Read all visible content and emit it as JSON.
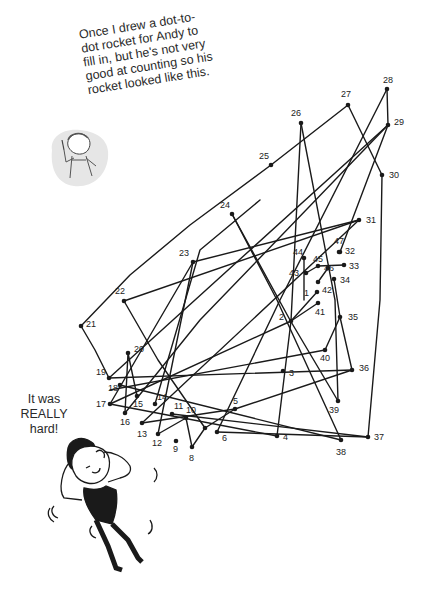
{
  "caption": {
    "lines": [
      "Once I drew a dot-to-",
      "dot rocket for Andy to",
      "fill in, but he's not very",
      "good at counting so his",
      "rocket looked like this."
    ]
  },
  "speech": {
    "lines": [
      "It was",
      "REALLY",
      "hard!"
    ]
  },
  "colors": {
    "ink": "#1a1a1a",
    "background": "#ffffff",
    "shading": "#e4e4e4"
  },
  "icons": [
    "cartoon-narrator-with-pencil",
    "cartoon-andy-stressed"
  ],
  "dots": [
    {
      "n": "1",
      "x": 317,
      "y": 292,
      "lx": 304,
      "ly": 296
    },
    {
      "n": "2",
      "x": 291,
      "y": 321,
      "lx": 279,
      "ly": 320
    },
    {
      "n": "3",
      "x": 283,
      "y": 371,
      "lx": 289,
      "ly": 376
    },
    {
      "n": "4",
      "x": 277,
      "y": 436,
      "lx": 283,
      "ly": 440
    },
    {
      "n": "5",
      "x": 235,
      "y": 409,
      "lx": 233,
      "ly": 404
    },
    {
      "n": "6",
      "x": 217,
      "y": 432,
      "lx": 222,
      "ly": 441
    },
    {
      "n": "7",
      "x": 205,
      "y": 428,
      "lx": 0,
      "ly": 0,
      "hidden_label": true
    },
    {
      "n": "8",
      "x": 192,
      "y": 447,
      "lx": 189,
      "ly": 461
    },
    {
      "n": "9",
      "x": 176,
      "y": 441,
      "lx": 173,
      "ly": 452
    },
    {
      "n": "10",
      "x": 186,
      "y": 418,
      "lx": 186,
      "ly": 413
    },
    {
      "n": "11",
      "x": 172,
      "y": 414,
      "lx": 174,
      "ly": 409
    },
    {
      "n": "12",
      "x": 158,
      "y": 434,
      "lx": 152,
      "ly": 446
    },
    {
      "n": "13",
      "x": 142,
      "y": 423,
      "lx": 137,
      "ly": 437
    },
    {
      "n": "14",
      "x": 155,
      "y": 404,
      "lx": 157,
      "ly": 400
    },
    {
      "n": "15",
      "x": 137,
      "y": 396,
      "lx": 133,
      "ly": 407
    },
    {
      "n": "16",
      "x": 125,
      "y": 413,
      "lx": 120,
      "ly": 425
    },
    {
      "n": "17",
      "x": 110,
      "y": 404,
      "lx": 96,
      "ly": 407
    },
    {
      "n": "18",
      "x": 120,
      "y": 385,
      "lx": 108,
      "ly": 391
    },
    {
      "n": "19",
      "x": 109,
      "y": 378,
      "lx": 96,
      "ly": 375
    },
    {
      "n": "20",
      "x": 128,
      "y": 353,
      "lx": 134,
      "ly": 352
    },
    {
      "n": "21",
      "x": 81,
      "y": 326,
      "lx": 86,
      "ly": 327
    },
    {
      "n": "22",
      "x": 124,
      "y": 301,
      "lx": 115,
      "ly": 294
    },
    {
      "n": "23",
      "x": 193,
      "y": 262,
      "lx": 179,
      "ly": 256
    },
    {
      "n": "24",
      "x": 232,
      "y": 214,
      "lx": 220,
      "ly": 208
    },
    {
      "n": "25",
      "x": 271,
      "y": 165,
      "lx": 259,
      "ly": 159
    },
    {
      "n": "26",
      "x": 301,
      "y": 123,
      "lx": 291,
      "ly": 116
    },
    {
      "n": "27",
      "x": 348,
      "y": 105,
      "lx": 341,
      "ly": 97
    },
    {
      "n": "28",
      "x": 387,
      "y": 89,
      "lx": 383,
      "ly": 83
    },
    {
      "n": "29",
      "x": 388,
      "y": 125,
      "lx": 394,
      "ly": 125
    },
    {
      "n": "30",
      "x": 382,
      "y": 175,
      "lx": 389,
      "ly": 178
    },
    {
      "n": "31",
      "x": 359,
      "y": 220,
      "lx": 366,
      "ly": 223
    },
    {
      "n": "32",
      "x": 340,
      "y": 252,
      "lx": 345,
      "ly": 254
    },
    {
      "n": "33",
      "x": 344,
      "y": 265,
      "lx": 349,
      "ly": 269
    },
    {
      "n": "34",
      "x": 334,
      "y": 279,
      "lx": 340,
      "ly": 283
    },
    {
      "n": "35",
      "x": 340,
      "y": 317,
      "lx": 348,
      "ly": 320
    },
    {
      "n": "36",
      "x": 352,
      "y": 370,
      "lx": 359,
      "ly": 371
    },
    {
      "n": "37",
      "x": 368,
      "y": 437,
      "lx": 374,
      "ly": 440
    },
    {
      "n": "38",
      "x": 341,
      "y": 440,
      "lx": 336,
      "ly": 455
    },
    {
      "n": "39",
      "x": 338,
      "y": 401,
      "lx": 329,
      "ly": 413
    },
    {
      "n": "40",
      "x": 325,
      "y": 350,
      "lx": 320,
      "ly": 361
    },
    {
      "n": "41",
      "x": 318,
      "y": 303,
      "lx": 315,
      "ly": 315
    },
    {
      "n": "42",
      "x": 318,
      "y": 282,
      "lx": 322,
      "ly": 293
    },
    {
      "n": "43",
      "x": 306,
      "y": 273,
      "lx": 289,
      "ly": 276
    },
    {
      "n": "44",
      "x": 304,
      "y": 258,
      "lx": 293,
      "ly": 255
    },
    {
      "n": "45",
      "x": 318,
      "y": 266,
      "lx": 313,
      "ly": 262
    },
    {
      "n": "46",
      "x": 328,
      "y": 268,
      "lx": 324,
      "ly": 271
    },
    {
      "n": "47",
      "x": 339,
      "y": 252,
      "lx": 334,
      "ly": 244
    }
  ],
  "lines": [
    [
      81,
      326,
      130,
      275,
      190,
      225,
      271,
      165
    ],
    [
      271,
      165,
      348,
      105
    ],
    [
      348,
      105,
      382,
      175
    ],
    [
      382,
      175,
      380,
      300,
      368,
      437
    ],
    [
      81,
      326,
      95,
      350,
      109,
      378
    ],
    [
      109,
      378,
      388,
      125
    ],
    [
      388,
      125,
      387,
      89
    ],
    [
      387,
      89,
      280,
      300,
      217,
      432
    ],
    [
      124,
      301,
      359,
      220
    ],
    [
      124,
      301,
      158,
      360,
      205,
      428
    ],
    [
      193,
      262,
      110,
      404
    ],
    [
      193,
      262,
      359,
      220
    ],
    [
      193,
      262,
      158,
      434
    ],
    [
      232,
      214,
      277,
      300,
      341,
      440
    ],
    [
      232,
      214,
      290,
      320,
      338,
      401
    ],
    [
      301,
      123,
      291,
      321
    ],
    [
      301,
      123,
      335,
      300,
      338,
      401
    ],
    [
      388,
      125,
      200,
      320,
      125,
      413
    ],
    [
      388,
      125,
      340,
      252
    ],
    [
      359,
      220,
      142,
      423
    ],
    [
      109,
      378,
      352,
      370
    ],
    [
      352,
      370,
      235,
      409,
      142,
      423
    ],
    [
      110,
      404,
      277,
      436
    ],
    [
      120,
      385,
      341,
      440
    ],
    [
      137,
      396,
      128,
      353,
      125,
      413
    ],
    [
      155,
      404,
      200,
      250,
      260,
      200
    ],
    [
      158,
      434,
      186,
      418,
      192,
      447,
      205,
      428,
      235,
      409
    ],
    [
      172,
      414,
      368,
      437
    ],
    [
      217,
      432,
      368,
      437
    ],
    [
      291,
      321,
      277,
      436
    ],
    [
      291,
      321,
      110,
      404
    ],
    [
      291,
      321,
      318,
      303
    ],
    [
      291,
      321,
      317,
      292
    ],
    [
      340,
      317,
      325,
      350
    ],
    [
      340,
      317,
      352,
      370
    ],
    [
      334,
      279,
      340,
      317
    ],
    [
      318,
      266,
      344,
      265
    ],
    [
      306,
      273,
      318,
      266
    ],
    [
      318,
      282,
      328,
      268
    ],
    [
      304,
      258,
      304,
      300
    ],
    [
      325,
      350,
      110,
      390
    ]
  ]
}
